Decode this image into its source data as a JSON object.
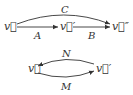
{
  "diagrams": [
    {
      "nodes": [
        {
          "id": "v",
          "label": "v⃗"
        },
        {
          "id": "v1",
          "label": "v⃗′"
        },
        {
          "id": "v2",
          "label": "v⃗″"
        }
      ],
      "edges": [
        {
          "from": "v",
          "to": "v1",
          "label": "A"
        },
        {
          "from": "v1",
          "to": "v2",
          "label": "B"
        },
        {
          "from": "v",
          "to": "v2",
          "label": "C",
          "curved": true
        }
      ]
    },
    {
      "nodes": [
        {
          "id": "v",
          "label": "v⃗"
        },
        {
          "id": "v1",
          "label": "v⃗′"
        }
      ],
      "edges": [
        {
          "from": "v1",
          "to": "v",
          "label": "N",
          "curved": true
        },
        {
          "from": "v",
          "to": "v1",
          "label": "M",
          "curved": true
        }
      ]
    }
  ],
  "colors": {
    "ink": "#333333",
    "background": "#ffffff"
  }
}
